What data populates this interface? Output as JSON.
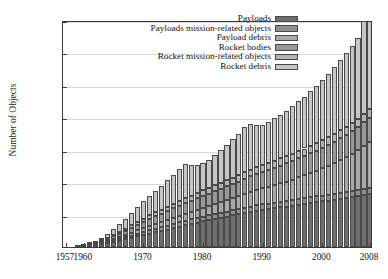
{
  "chart_data": {
    "type": "bar",
    "stacked": true,
    "title": "",
    "xlabel": "",
    "ylabel": "Number of Objects",
    "ylim": [
      0,
      14000
    ],
    "xlim": [
      1957,
      2008
    ],
    "grid": true,
    "legend_position": "top-right-inside",
    "ytick_labels": [
      "0",
      "2000",
      "4000",
      "6000",
      "8000",
      "10,000",
      "12,000",
      "14,000"
    ],
    "ytick_values": [
      0,
      2000,
      4000,
      6000,
      8000,
      10000,
      12000,
      14000
    ],
    "xtick_labels": [
      "1957",
      "1960",
      "1970",
      "1980",
      "1990",
      "2000",
      "2008"
    ],
    "xtick_values": [
      1957,
      1960,
      1970,
      1980,
      1990,
      2000,
      2008
    ],
    "x": [
      1957,
      1958,
      1959,
      1960,
      1961,
      1962,
      1963,
      1964,
      1965,
      1966,
      1967,
      1968,
      1969,
      1970,
      1971,
      1972,
      1973,
      1974,
      1975,
      1976,
      1977,
      1978,
      1979,
      1980,
      1981,
      1982,
      1983,
      1984,
      1985,
      1986,
      1987,
      1988,
      1989,
      1990,
      1991,
      1992,
      1993,
      1994,
      1995,
      1996,
      1997,
      1998,
      1999,
      2000,
      2001,
      2002,
      2003,
      2004,
      2005,
      2006,
      2007,
      2008
    ],
    "series": [
      {
        "name": "Payloads",
        "color": "#6e6e6e",
        "values": [
          2,
          8,
          18,
          35,
          70,
          120,
          175,
          240,
          310,
          390,
          470,
          560,
          650,
          740,
          830,
          910,
          990,
          1080,
          1170,
          1260,
          1340,
          1430,
          1510,
          1590,
          1660,
          1740,
          1810,
          1880,
          1950,
          2020,
          2090,
          2160,
          2230,
          2290,
          2340,
          2390,
          2440,
          2490,
          2550,
          2610,
          2660,
          2710,
          2760,
          2810,
          2860,
          2910,
          2960,
          3010,
          3070,
          3130,
          3200,
          3250
        ]
      },
      {
        "name": "Payloads mission-related objects",
        "color": "#8f8f8f",
        "values": [
          0,
          2,
          5,
          10,
          20,
          35,
          50,
          70,
          90,
          110,
          130,
          150,
          170,
          190,
          205,
          215,
          225,
          235,
          245,
          255,
          265,
          272,
          278,
          284,
          290,
          296,
          302,
          308,
          314,
          320,
          326,
          330,
          334,
          338,
          341,
          344,
          347,
          350,
          353,
          356,
          358,
          360,
          362,
          364,
          366,
          368,
          370,
          372,
          374,
          376,
          378,
          380
        ]
      },
      {
        "name": "Payload debris",
        "color": "#a8a8a8",
        "values": [
          0,
          0,
          3,
          8,
          18,
          30,
          48,
          70,
          95,
          120,
          150,
          180,
          210,
          240,
          270,
          300,
          330,
          360,
          390,
          420,
          450,
          480,
          510,
          545,
          580,
          620,
          660,
          700,
          745,
          790,
          840,
          890,
          940,
          990,
          1040,
          1090,
          1140,
          1200,
          1260,
          1330,
          1400,
          1480,
          1570,
          1670,
          1780,
          1900,
          2030,
          2170,
          2320,
          2490,
          2680,
          2860
        ]
      },
      {
        "name": "Rocket bodies",
        "color": "#989898",
        "values": [
          1,
          4,
          10,
          20,
          40,
          65,
          95,
          130,
          170,
          210,
          255,
          300,
          345,
          390,
          430,
          470,
          505,
          540,
          575,
          610,
          640,
          670,
          700,
          730,
          760,
          790,
          820,
          850,
          880,
          910,
          940,
          970,
          1000,
          1025,
          1050,
          1075,
          1100,
          1125,
          1150,
          1175,
          1200,
          1225,
          1250,
          1275,
          1300,
          1325,
          1350,
          1375,
          1400,
          1430,
          1460,
          1490
        ]
      },
      {
        "name": "Rocket mission-related objects",
        "color": "#b4b4b4",
        "values": [
          0,
          1,
          3,
          6,
          14,
          24,
          38,
          55,
          75,
          95,
          118,
          142,
          168,
          195,
          215,
          235,
          252,
          268,
          284,
          298,
          310,
          322,
          332,
          342,
          352,
          360,
          368,
          376,
          384,
          392,
          400,
          408,
          414,
          420,
          426,
          432,
          438,
          443,
          448,
          453,
          458,
          463,
          468,
          472,
          476,
          480,
          484,
          488,
          492,
          496,
          500,
          504
        ]
      },
      {
        "name": "Rocket debris",
        "color": "#c6c6c6",
        "values": [
          0,
          2,
          8,
          20,
          50,
          95,
          160,
          250,
          360,
          480,
          620,
          760,
          910,
          1060,
          1200,
          1340,
          1490,
          1640,
          1800,
          1960,
          2100,
          1890,
          1750,
          1680,
          1750,
          1880,
          2030,
          2180,
          2360,
          2560,
          2780,
          2830,
          2620,
          2480,
          2520,
          2600,
          2700,
          2810,
          2930,
          3060,
          3200,
          3360,
          3530,
          3710,
          3900,
          4100,
          4310,
          4530,
          4760,
          5000,
          6440,
          6300
        ]
      }
    ]
  }
}
